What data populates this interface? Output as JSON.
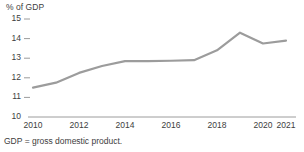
{
  "chart_data": {
    "type": "line",
    "title": "",
    "subtitle": "",
    "xlabel": "",
    "ylabel": "% of GDP",
    "x": [
      2010,
      2011,
      2012,
      2013,
      2014,
      2015,
      2016,
      2017,
      2018,
      2019,
      2020,
      2021
    ],
    "values": [
      11.5,
      11.75,
      12.25,
      12.6,
      12.85,
      12.85,
      12.87,
      12.9,
      13.4,
      14.3,
      13.75,
      13.9
    ],
    "series": [
      {
        "name": "% of GDP",
        "values": [
          11.5,
          11.75,
          12.25,
          12.6,
          12.85,
          12.85,
          12.87,
          12.9,
          13.4,
          14.3,
          13.75,
          13.9
        ]
      }
    ],
    "xlim": [
      2010,
      2021
    ],
    "ylim": [
      10,
      15
    ],
    "ytick_labels": [
      "10",
      "11",
      "12",
      "13",
      "14",
      "15"
    ],
    "ytick_values": [
      10,
      11,
      12,
      13,
      14,
      15
    ],
    "xtick_labels": [
      "2010",
      "2012",
      "2014",
      "2016",
      "2018",
      "2020",
      "2021"
    ],
    "xtick_values": [
      2010,
      2012,
      2014,
      2016,
      2018,
      2020,
      2021
    ],
    "grid": false,
    "legend": false,
    "legend_position": "none",
    "line_color": "#9c9c9c",
    "axis_color": "#9c9c9c",
    "text_color": "#3d3d3d",
    "footnote": "GDP = gross domestic product."
  }
}
